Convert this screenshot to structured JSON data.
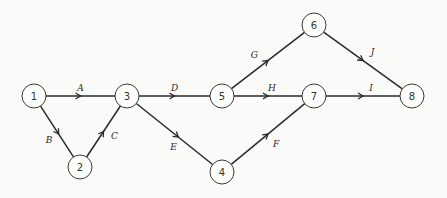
{
  "diagram": {
    "type": "activity-on-arrow network",
    "nodes": [
      {
        "id": "1",
        "label": "1",
        "x": 34,
        "y": 96
      },
      {
        "id": "2",
        "label": "2",
        "x": 80,
        "y": 167
      },
      {
        "id": "3",
        "label": "3",
        "x": 127,
        "y": 96
      },
      {
        "id": "4",
        "label": "4",
        "x": 222,
        "y": 172
      },
      {
        "id": "5",
        "label": "5",
        "x": 222,
        "y": 96
      },
      {
        "id": "6",
        "label": "6",
        "x": 314,
        "y": 25
      },
      {
        "id": "7",
        "label": "7",
        "x": 314,
        "y": 96
      },
      {
        "id": "8",
        "label": "8",
        "x": 412,
        "y": 96
      }
    ],
    "edges": [
      {
        "id": "A",
        "label": "A",
        "from": "1",
        "to": "3"
      },
      {
        "id": "B",
        "label": "B",
        "from": "1",
        "to": "2"
      },
      {
        "id": "C",
        "label": "C",
        "from": "2",
        "to": "3"
      },
      {
        "id": "D",
        "label": "D",
        "from": "3",
        "to": "5"
      },
      {
        "id": "E",
        "label": "E",
        "from": "3",
        "to": "4"
      },
      {
        "id": "F",
        "label": "F",
        "from": "4",
        "to": "7"
      },
      {
        "id": "G",
        "label": "G",
        "from": "5",
        "to": "6"
      },
      {
        "id": "H",
        "label": "H",
        "from": "5",
        "to": "7"
      },
      {
        "id": "I",
        "label": "I",
        "from": "7",
        "to": "8"
      },
      {
        "id": "J",
        "label": "J",
        "from": "6",
        "to": "8"
      }
    ],
    "style": {
      "line_color": "#2a2a2a",
      "node_fill": "#fdfdfb",
      "background": "#fafaf8"
    }
  }
}
